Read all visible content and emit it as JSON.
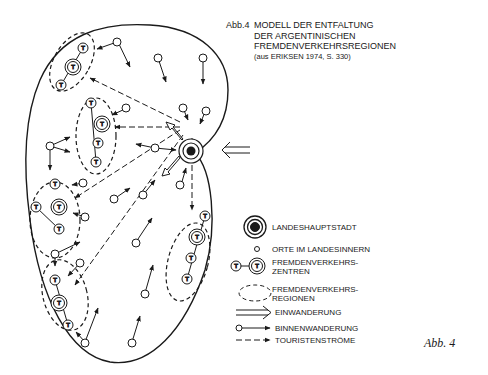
{
  "title": {
    "figure_label": "Abb.4",
    "lines": [
      "MODELL DER ENTFALTUNG",
      "DER ARGENTINISCHEN",
      "FREMDENVERKEHRSREGIONEN"
    ],
    "source": "(aus ERIKSEN 1974, S. 330)"
  },
  "legend": {
    "items": [
      {
        "symbol": "capital-circle",
        "label": "LANDESHAUPTSTADT"
      },
      {
        "symbol": "small-circle",
        "label": "ORTE IM LANDESINNERN"
      },
      {
        "symbol": "t-circle-pair",
        "label": "FREMDENVERKEHRS-\nZENTREN"
      },
      {
        "symbol": "dashed-ellipse",
        "label": "FREMDENVERKEHRS-\nREGIONEN"
      },
      {
        "symbol": "double-arrow",
        "label": "EINWANDERUNG"
      },
      {
        "symbol": "circle-arrow",
        "label": "BINNENWANDERUNG"
      },
      {
        "symbol": "dashed-arrow",
        "label": "TOURISTENSTRÖME"
      }
    ]
  },
  "node_letter": "T",
  "caption": "Abb. 4",
  "colors": {
    "ink": "#1a1a1a",
    "background": "#ffffff"
  }
}
